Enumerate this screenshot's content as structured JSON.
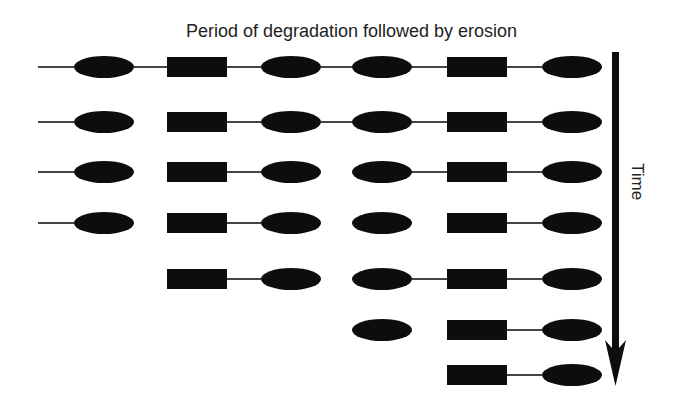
{
  "title": "Period of degradation followed by erosion",
  "axis": {
    "label": "Time",
    "direction": "down"
  },
  "colors": {
    "shape": "#0d0d0d",
    "line": "#444444",
    "text": "#222222",
    "background": "#ffffff"
  },
  "columns": [
    {
      "id": "E1",
      "shape": "ellipse",
      "cx": 104
    },
    {
      "id": "R1",
      "shape": "rect",
      "cx": 197
    },
    {
      "id": "E2",
      "shape": "ellipse",
      "cx": 291
    },
    {
      "id": "E3",
      "shape": "ellipse",
      "cx": 382
    },
    {
      "id": "R2",
      "shape": "rect",
      "cx": 477
    },
    {
      "id": "E4",
      "shape": "ellipse",
      "cx": 572
    }
  ],
  "rows": [
    {
      "y": 67,
      "lead": true,
      "present": [
        "E1",
        "R1",
        "E2",
        "E3",
        "R2",
        "E4"
      ],
      "links": [
        "E1-R1",
        "R1-E2",
        "E2-E3",
        "E3-R2",
        "R2-E4"
      ]
    },
    {
      "y": 122,
      "lead": true,
      "present": [
        "E1",
        "R1",
        "E2",
        "E3",
        "R2",
        "E4"
      ],
      "links": [
        "R1-E2",
        "E2-E3",
        "E3-R2",
        "R2-E4"
      ]
    },
    {
      "y": 172,
      "lead": true,
      "present": [
        "E1",
        "R1",
        "E2",
        "E3",
        "R2",
        "E4"
      ],
      "links": [
        "R1-E2",
        "E3-R2",
        "R2-E4"
      ]
    },
    {
      "y": 223,
      "lead": true,
      "present": [
        "E1",
        "R1",
        "E2",
        "E3",
        "R2",
        "E4"
      ],
      "links": [
        "R1-E2",
        "R2-E4"
      ]
    },
    {
      "y": 279,
      "lead": false,
      "present": [
        "R1",
        "E2",
        "E3",
        "R2",
        "E4"
      ],
      "links": [
        "R1-E2",
        "E3-R2",
        "R2-E4"
      ]
    },
    {
      "y": 330,
      "lead": false,
      "present": [
        "E3",
        "R2",
        "E4"
      ],
      "links": [
        "R2-E4"
      ]
    },
    {
      "y": 375,
      "lead": false,
      "present": [
        "R2",
        "E4"
      ],
      "links": [
        "R2-E4"
      ]
    }
  ]
}
